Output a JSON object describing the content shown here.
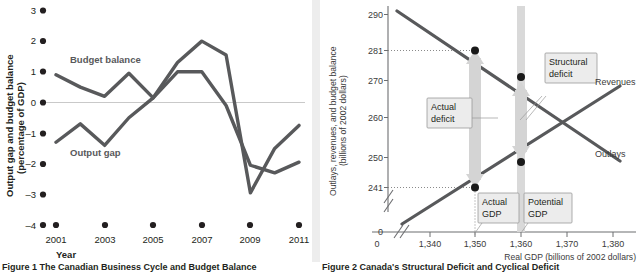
{
  "figure_left": {
    "caption": "Figure 1  The Canadian Business Cycle and Budget Balance",
    "y_axis_title_line1": "Output gap and budget balance",
    "y_axis_title_line2": "(percentage of GDP)",
    "x_axis_title": "Year",
    "series_label_budget": "Budget balance",
    "series_label_output": "Output gap"
  },
  "figure_right": {
    "caption": "Figure 2  Canada's Structural Deficit and Cyclical Deficit",
    "y_axis_title_line1": "Outlays, revenues, and budget balance",
    "y_axis_title_line2": "(billions of 2002 dollars)",
    "x_axis_title": "Real GDP (billions of 2002 dollars)",
    "label_revenues": "Revenues",
    "label_outlays": "Outlays",
    "callout_actual_deficit_l1": "Actual",
    "callout_actual_deficit_l2": "deficit",
    "callout_structural_deficit_l1": "Structural",
    "callout_structural_deficit_l2": "deficit",
    "callout_actual_gdp_l1": "Actual",
    "callout_actual_gdp_l2": "GDP",
    "callout_potential_gdp_l1": "Potential",
    "callout_potential_gdp_l2": "GDP"
  },
  "chart_data": [
    {
      "type": "line",
      "title": "The Canadian Business Cycle and Budget Balance",
      "xlabel": "Year",
      "ylabel": "Output gap and budget balance (percentage of GDP)",
      "x": [
        2001,
        2002,
        2003,
        2004,
        2005,
        2006,
        2007,
        2008,
        2009,
        2010,
        2011
      ],
      "xtick_labels": [
        "2001",
        "2003",
        "2005",
        "2007",
        "2009",
        "2011"
      ],
      "xticks": [
        2001,
        2003,
        2005,
        2007,
        2009,
        2011
      ],
      "ytick_labels": [
        "3",
        "2",
        "1",
        "0",
        "–1",
        "–2",
        "–3",
        "–4"
      ],
      "yticks": [
        3,
        2,
        1,
        0,
        -1,
        -2,
        -3,
        -4
      ],
      "ylim": [
        -4,
        3
      ],
      "xlim": [
        2000.6,
        2011.4
      ],
      "grid": false,
      "zero_line": true,
      "legend": "inline-annotations",
      "series": [
        {
          "name": "Budget balance",
          "values": [
            0.9,
            0.5,
            0.2,
            0.95,
            0.15,
            1.0,
            1.0,
            -0.1,
            -2.05,
            -2.3,
            -1.95
          ]
        },
        {
          "name": "Output gap",
          "values": [
            -1.3,
            -0.7,
            -1.4,
            -0.5,
            0.15,
            1.3,
            2.0,
            1.55,
            -2.95,
            -1.5,
            -0.75
          ]
        }
      ]
    },
    {
      "type": "line",
      "title": "Canada's Structural Deficit and Cyclical Deficit",
      "xlabel": "Real GDP (billions of 2002 dollars)",
      "ylabel": "Outlays, revenues, and budget balance (billions of 2002 dollars)",
      "xtick_labels": [
        "0",
        "1,340",
        "1,350",
        "1,360",
        "1,370",
        "1,380"
      ],
      "xticks": [
        0,
        1340,
        1350,
        1360,
        1370,
        1380
      ],
      "ytick_labels": [
        "0",
        "241",
        "250",
        "260",
        "270",
        "281",
        "290"
      ],
      "yticks": [
        0,
        241,
        250,
        260,
        270,
        281,
        290
      ],
      "xlim": [
        1334,
        1388
      ],
      "ylim": [
        234,
        294
      ],
      "axis_break": true,
      "grid": false,
      "legend": "inline-annotations",
      "series": [
        {
          "name": "Outlays",
          "slope": "negative",
          "points": [
            {
              "x": 1337,
              "y": 292.5
            },
            {
              "x": 1386,
              "y": 252.5
            }
          ]
        },
        {
          "name": "Revenues",
          "slope": "positive",
          "points": [
            {
              "x": 1338,
              "y": 236.5
            },
            {
              "x": 1386,
              "y": 272.5
            }
          ]
        }
      ],
      "markers": [
        {
          "x": 1350,
          "y": 281,
          "series": "Outlays",
          "label": "actual-outlays"
        },
        {
          "x": 1350,
          "y": 241,
          "series": "Revenues",
          "label": "actual-revenues"
        },
        {
          "x": 1360,
          "y": 273,
          "series": "Outlays",
          "label": "potential-outlays"
        },
        {
          "x": 1360,
          "y": 248.5,
          "series": "Revenues",
          "label": "potential-revenues"
        }
      ],
      "annotations": [
        {
          "name": "Actual deficit",
          "from": {
            "x": 1350,
            "y": 281
          },
          "to": {
            "x": 1350,
            "y": 241
          },
          "value": 40
        },
        {
          "name": "Structural deficit",
          "from": {
            "x": 1360,
            "y": 273
          },
          "to": {
            "x": 1360,
            "y": 248.5
          },
          "value": 24.5
        },
        {
          "name": "Actual GDP",
          "x": 1350
        },
        {
          "name": "Potential GDP",
          "x": 1360
        }
      ]
    }
  ]
}
